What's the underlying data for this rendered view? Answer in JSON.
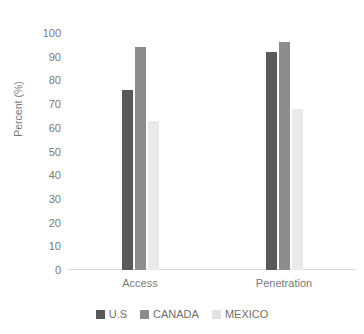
{
  "chart_data": {
    "type": "bar",
    "title": "Penetration",
    "xlabel": "",
    "ylabel": "Percent (%)",
    "ylim": [
      0,
      100
    ],
    "yticks": [
      100,
      90,
      80,
      70,
      60,
      50,
      40,
      30,
      20,
      10,
      0
    ],
    "categories": [
      "Access",
      "Penetration"
    ],
    "grid": false,
    "legend_position": "bottom",
    "series": [
      {
        "name": "U.S",
        "color": "#595959",
        "values": [
          76,
          92
        ]
      },
      {
        "name": "CANADA",
        "color": "#8c8c8c",
        "values": [
          94,
          96
        ]
      },
      {
        "name": "MEXICO",
        "color": "#e9e9e9",
        "values": [
          63,
          68
        ]
      }
    ]
  }
}
